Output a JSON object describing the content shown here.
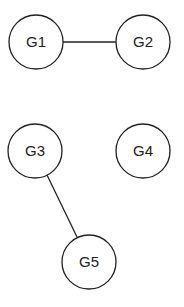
{
  "diagram": {
    "type": "undirected-graph",
    "stroke_color": "#222222",
    "node_radius": 27,
    "nodes": [
      {
        "id": "G1",
        "label": "G1",
        "x": 36,
        "y": 42
      },
      {
        "id": "G2",
        "label": "G2",
        "x": 143,
        "y": 42
      },
      {
        "id": "G3",
        "label": "G3",
        "x": 35,
        "y": 151
      },
      {
        "id": "G4",
        "label": "G4",
        "x": 143,
        "y": 151
      },
      {
        "id": "G5",
        "label": "G5",
        "x": 89,
        "y": 262
      }
    ],
    "edges": [
      {
        "from": "G1",
        "to": "G2"
      },
      {
        "from": "G3",
        "to": "G5"
      }
    ]
  }
}
